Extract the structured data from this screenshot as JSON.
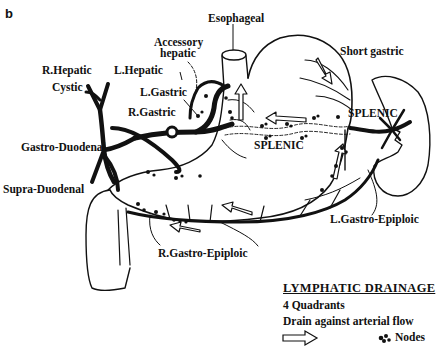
{
  "panel_label": "b",
  "labels": {
    "esophageal": "Esophageal",
    "accessory_hepatic_1": "Accessory",
    "accessory_hepatic_2": "hepatic",
    "short_gastric": "Short gastric",
    "r_hepatic": "R.Hepatic",
    "l_hepatic": "L.Hepatic",
    "cystic": "Cystic",
    "l_gastric": "L.Gastric",
    "r_gastric": "R.Gastric",
    "gastro_duodenal": "Gastro-Duodenal",
    "supra_duodenal": "Supra-Duodenal",
    "splenic_center": "SPLENIC",
    "splenic_right": "SPLENIC",
    "l_gastro_epiploic": "L.Gastro-Epiploic",
    "r_gastro_epiploic": "R.Gastro-Epiploic"
  },
  "legend": {
    "title": "LYMPHATIC DRAINAGE",
    "line1": "4 Quadrants",
    "line2": "Drain against arterial flow",
    "nodes_label": "Nodes",
    "arrow_icon": "outline-arrow-right",
    "nodes_icon": "node-cluster"
  },
  "colors": {
    "ink": "#111111",
    "background": "#ffffff"
  }
}
